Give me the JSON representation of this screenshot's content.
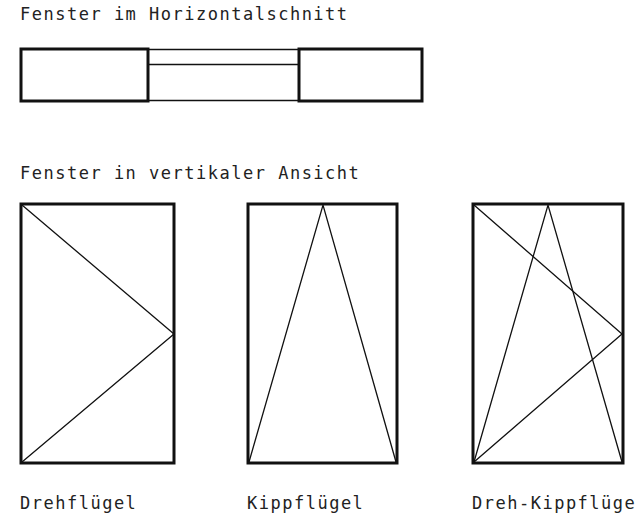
{
  "section1": {
    "title": "Fenster im Horizontalschnitt"
  },
  "section2": {
    "title": "Fenster in vertikaler Ansicht"
  },
  "windows": [
    {
      "label": "Drehflügel"
    },
    {
      "label": "Kippflügel"
    },
    {
      "label": "Dreh-Kippflüge"
    }
  ],
  "colors": {
    "stroke": "#111111",
    "background": "#ffffff"
  }
}
